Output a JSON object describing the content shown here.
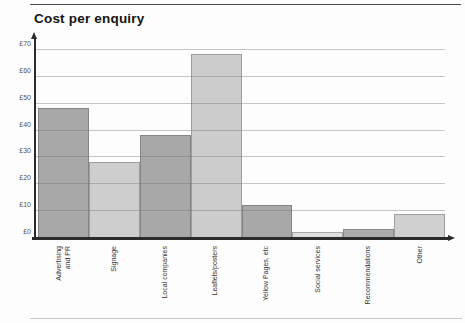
{
  "chart_data": {
    "type": "bar",
    "title": "Cost per enquiry",
    "categories": [
      "Advertising and PR",
      "Signage",
      "Local companies",
      "Leaflets/posters",
      "Yellow Pages, etc",
      "Social services",
      "Recommendations",
      "Other"
    ],
    "label_lines": [
      [
        "Advertising",
        "and PR"
      ],
      [
        "Signage"
      ],
      [
        "Local companies"
      ],
      [
        "Leaflets/posters"
      ],
      [
        "Yellow Pages, etc"
      ],
      [
        "Social services"
      ],
      [
        "Recommendations"
      ],
      [
        "Other"
      ]
    ],
    "values": [
      48,
      28,
      38,
      68,
      12,
      2,
      3,
      8.5
    ],
    "unit_prefix": "£",
    "y_ticks": [
      0,
      10,
      20,
      30,
      40,
      50,
      60,
      70
    ],
    "ylim": [
      0,
      70
    ],
    "xlabel": "",
    "ylabel": "",
    "grid": true,
    "legend": null,
    "bar_colors": [
      "#a8a8a8",
      "#cecece",
      "#a8a8a8",
      "#cccccc",
      "#a8a8a8",
      "#dedede",
      "#adadad",
      "#d0d0d0"
    ],
    "axis_color": "#2b2b2b",
    "gridline_color": "rgba(118,118,118,0.42)",
    "background_color": "#fdfdfd"
  }
}
